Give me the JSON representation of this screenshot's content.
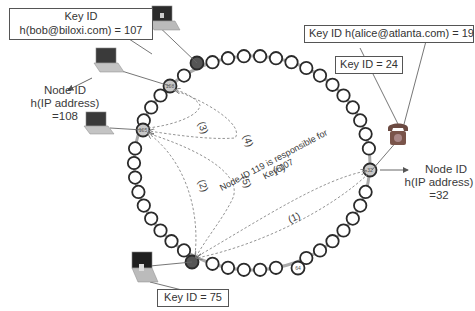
{
  "diagram": {
    "type": "DHT ring lookup (Chord)",
    "labels": {
      "bob_key_title": "Key ID",
      "bob_key_value": "h(bob@biloxi.com) = 107",
      "alice_key": "Key ID h(alice@atlanta.com) = 19",
      "key24": "Key ID = 24",
      "key75": "Key ID = 75",
      "node108_line1": "Node ID",
      "node108_line2": "h(IP address)",
      "node108_line3": "=108",
      "node32_line1": "Node ID",
      "node32_line2": "h(IP address)",
      "node32_line3": "=32",
      "response_line1": "Node ID 119 is responsible for",
      "response_line2": "Key 107"
    },
    "steps": [
      "(1)",
      "(2)",
      "(3)",
      "(4)",
      "(5)",
      "(6)"
    ],
    "nodes": [
      {
        "id": "119",
        "role": "dark-node"
      },
      {
        "id": "108",
        "role": "labeled-node"
      },
      {
        "id": "105",
        "role": "labeled-node"
      },
      {
        "id": "32",
        "role": "labeled-node"
      },
      {
        "id": "75",
        "role": "dark-node"
      },
      {
        "id": "64",
        "role": "labeled-node"
      }
    ],
    "colors": {
      "ring_stroke": "#2a2a2a",
      "dark_node": "#555555",
      "gray_node": "#c8c8c8",
      "arrow": "#777777"
    }
  }
}
